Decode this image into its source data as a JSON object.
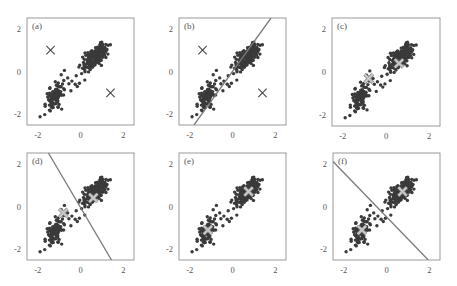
{
  "figure": {
    "panel_labels": [
      "(a)",
      "(b)",
      "(c)",
      "(d)",
      "(e)",
      "(f)"
    ],
    "x_ticks": [
      "-2",
      "0",
      "2"
    ],
    "y_ticks": [
      "2",
      "0",
      "-2"
    ],
    "colors": {
      "frame": "#9a9a9a",
      "points": "#3a3a3a",
      "center_marker": "#444444",
      "center_marker_light": "#c8c8c8",
      "boundary_line": "#7a7a7a",
      "tick_text": "#555555"
    }
  },
  "chart_data": [
    {
      "type": "scatter",
      "title": "(a)",
      "xlim": [
        -2.5,
        2.5
      ],
      "ylim": [
        -2.5,
        2.5
      ],
      "x_ticks": [
        -2,
        0,
        2
      ],
      "y_ticks": [
        -2,
        0,
        2
      ],
      "grid": false,
      "clusters": [
        {
          "name": "upper cluster",
          "center_approx": [
            0.7,
            0.7
          ]
        },
        {
          "name": "lower cluster",
          "center_approx": [
            -1.25,
            -1.2
          ]
        }
      ],
      "markers": [
        {
          "symbol": "x",
          "x": -1.4,
          "y": 1.0,
          "color": "dark"
        },
        {
          "symbol": "x",
          "x": 1.4,
          "y": -1.0,
          "color": "dark"
        }
      ],
      "boundary": null
    },
    {
      "type": "scatter",
      "title": "(b)",
      "xlim": [
        -2.5,
        2.5
      ],
      "ylim": [
        -2.5,
        2.5
      ],
      "x_ticks": [
        -2,
        0,
        2
      ],
      "y_ticks": [
        -2,
        0,
        2
      ],
      "grid": false,
      "markers": [
        {
          "symbol": "x",
          "x": -1.4,
          "y": 1.0,
          "color": "dark"
        },
        {
          "symbol": "x",
          "x": 1.4,
          "y": -1.0,
          "color": "dark"
        }
      ],
      "boundary": {
        "x1": -1.8,
        "y1": -2.5,
        "x2": 1.8,
        "y2": 2.5
      }
    },
    {
      "type": "scatter",
      "title": "(c)",
      "xlim": [
        -2.5,
        2.5
      ],
      "ylim": [
        -2.5,
        2.5
      ],
      "x_ticks": [
        -2,
        0,
        2
      ],
      "y_ticks": [
        -2,
        0,
        2
      ],
      "grid": false,
      "markers": [
        {
          "symbol": "x",
          "x": -0.8,
          "y": -0.3,
          "color": "light"
        },
        {
          "symbol": "x",
          "x": 0.6,
          "y": 0.4,
          "color": "light"
        }
      ],
      "boundary": null
    },
    {
      "type": "scatter",
      "title": "(d)",
      "xlim": [
        -2.5,
        2.5
      ],
      "ylim": [
        -2.5,
        2.5
      ],
      "x_ticks": [
        -2,
        0,
        2
      ],
      "y_ticks": [
        -2,
        0,
        2
      ],
      "grid": false,
      "markers": [
        {
          "symbol": "x",
          "x": -0.8,
          "y": -0.3,
          "color": "light"
        },
        {
          "symbol": "x",
          "x": 0.6,
          "y": 0.4,
          "color": "light"
        }
      ],
      "boundary": {
        "x1": -1.5,
        "y1": 2.5,
        "x2": 1.45,
        "y2": -2.5
      }
    },
    {
      "type": "scatter",
      "title": "(e)",
      "xlim": [
        -2.5,
        2.5
      ],
      "ylim": [
        -2.5,
        2.5
      ],
      "x_ticks": [
        -2,
        0,
        2
      ],
      "y_ticks": [
        -2,
        0,
        2
      ],
      "grid": false,
      "markers": [
        {
          "symbol": "x",
          "x": -1.15,
          "y": -1.1,
          "color": "light"
        },
        {
          "symbol": "x",
          "x": 0.75,
          "y": 0.7,
          "color": "light"
        }
      ],
      "boundary": null
    },
    {
      "type": "scatter",
      "title": "(f)",
      "xlim": [
        -2.5,
        2.5
      ],
      "ylim": [
        -2.5,
        2.5
      ],
      "x_ticks": [
        -2,
        0,
        2
      ],
      "y_ticks": [
        -2,
        0,
        2
      ],
      "grid": false,
      "markers": [
        {
          "symbol": "x",
          "x": -1.15,
          "y": -1.1,
          "color": "light"
        },
        {
          "symbol": "x",
          "x": 0.75,
          "y": 0.7,
          "color": "light"
        }
      ],
      "boundary": {
        "x1": -2.5,
        "y1": 2.1,
        "x2": 1.95,
        "y2": -2.5
      }
    }
  ]
}
